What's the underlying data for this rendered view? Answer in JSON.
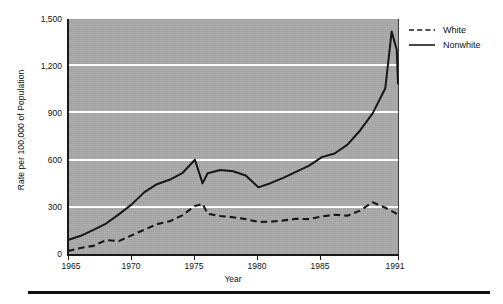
{
  "figure": {
    "background_color": "#ffffff",
    "plot_background_color": "#ababab",
    "gridline_color": "#ffffff",
    "line_color": "#1a1a1a"
  },
  "axis": {
    "y_title": "Rate per 100,000 of Population",
    "x_title": "Year",
    "y_tick_labels": [
      "1,500",
      "1,200",
      "900",
      "600",
      "300",
      "0"
    ],
    "x_tick_labels": [
      "1965",
      "1970",
      "1975",
      "1980",
      "1985",
      "1991"
    ]
  },
  "legend": {
    "items": [
      {
        "label": "White",
        "style": "dashed",
        "icon": "dashed-line-icon"
      },
      {
        "label": "Nonwhite",
        "style": "solid",
        "icon": "solid-line-icon"
      }
    ]
  },
  "caption": {
    "text": ""
  },
  "chart_data": {
    "type": "line",
    "title": "",
    "xlabel": "Year",
    "ylabel": "Rate per 100,000 of Population",
    "xlim": [
      1965,
      1991
    ],
    "ylim": [
      0,
      1500
    ],
    "yticks": [
      0,
      300,
      600,
      900,
      1200,
      1500
    ],
    "xticks": [
      1965,
      1970,
      1975,
      1980,
      1985,
      1991
    ],
    "grid": "horizontal",
    "legend_position": "right",
    "x": [
      1965,
      1966,
      1967,
      1968,
      1969,
      1970,
      1971,
      1972,
      1973,
      1974,
      1975,
      1976,
      1977,
      1978,
      1979,
      1980,
      1981,
      1982,
      1983,
      1984,
      1985,
      1986,
      1987,
      1988,
      1989,
      1990,
      1991
    ],
    "series": [
      {
        "name": "White",
        "style": "dashed",
        "values": [
          25,
          45,
          60,
          95,
          85,
          125,
          160,
          195,
          215,
          250,
          310,
          325,
          260,
          245,
          240,
          225,
          210,
          212,
          222,
          230,
          228,
          248,
          255,
          250,
          280,
          335,
          258
        ]
      },
      {
        "name": "Nonwhite",
        "style": "solid",
        "values": [
          95,
          125,
          160,
          200,
          255,
          320,
          395,
          450,
          480,
          520,
          605,
          455,
          520,
          540,
          535,
          505,
          430,
          455,
          490,
          530,
          570,
          620,
          640,
          700,
          790,
          900,
          1030
        ]
      }
    ],
    "annotations": []
  },
  "chart_render": {
    "white_points": [
      [
        1965,
        25
      ],
      [
        1966,
        45
      ],
      [
        1967,
        58
      ],
      [
        1968,
        95
      ],
      [
        1969,
        88
      ],
      [
        1970,
        125
      ],
      [
        1971,
        160
      ],
      [
        1972,
        196
      ],
      [
        1973,
        214
      ],
      [
        1974,
        252
      ],
      [
        1975,
        312
      ],
      [
        1975.6,
        325
      ],
      [
        1976,
        262
      ],
      [
        1977,
        248
      ],
      [
        1978,
        240
      ],
      [
        1979,
        228
      ],
      [
        1980,
        210
      ],
      [
        1981,
        212
      ],
      [
        1982,
        220
      ],
      [
        1983,
        230
      ],
      [
        1984,
        228
      ],
      [
        1985,
        245
      ],
      [
        1986,
        256
      ],
      [
        1987,
        250
      ],
      [
        1988,
        282
      ],
      [
        1989,
        335
      ],
      [
        1990,
        300
      ],
      [
        1991,
        258
      ]
    ],
    "nonwhite_points": [
      [
        1965,
        95
      ],
      [
        1966,
        122
      ],
      [
        1967,
        160
      ],
      [
        1968,
        200
      ],
      [
        1969,
        258
      ],
      [
        1970,
        320
      ],
      [
        1971,
        398
      ],
      [
        1972,
        450
      ],
      [
        1973,
        478
      ],
      [
        1974,
        520
      ],
      [
        1975,
        605
      ],
      [
        1975.6,
        455
      ],
      [
        1976,
        520
      ],
      [
        1977,
        540
      ],
      [
        1978,
        532
      ],
      [
        1979,
        505
      ],
      [
        1980,
        430
      ],
      [
        1981,
        458
      ],
      [
        1982,
        492
      ],
      [
        1983,
        530
      ],
      [
        1984,
        568
      ],
      [
        1985,
        622
      ],
      [
        1986,
        645
      ],
      [
        1987,
        700
      ],
      [
        1988,
        790
      ],
      [
        1989,
        900
      ],
      [
        1990,
        1060
      ],
      [
        1990.5,
        1420
      ],
      [
        1990.9,
        1305
      ],
      [
        1991,
        1090
      ]
    ]
  }
}
